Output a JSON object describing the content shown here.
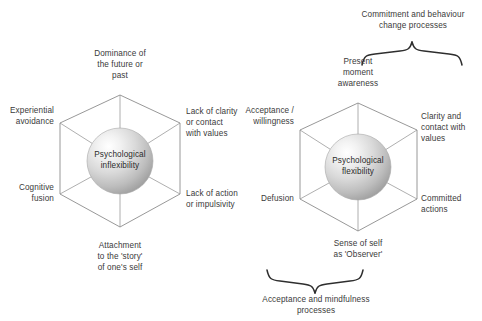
{
  "figure": {
    "title_hidden": "",
    "background_color": "#ffffff",
    "line_color": "#8c8c8c",
    "text_color": "#3a3a3a",
    "brace_color": "#2e2e2e"
  },
  "left_model": {
    "core_label": "Psychological\ninflexibility",
    "vertices": [
      {
        "position": "top",
        "label": "Dominance of\nthe future or\npast"
      },
      {
        "position": "upper-right",
        "label": "Lack of clarity\nor contact\nwith values"
      },
      {
        "position": "lower-right",
        "label": "Lack of action\nor impulsivity"
      },
      {
        "position": "bottom",
        "label": "Attachment\nto the 'story'\nof one's self"
      },
      {
        "position": "lower-left",
        "label": "Cognitive\nfusion"
      },
      {
        "position": "upper-left",
        "label": "Experiential\navoidance"
      }
    ]
  },
  "right_model": {
    "core_label": "Psychological\nflexibility",
    "vertices": [
      {
        "position": "top",
        "label": "Present\nmoment\nawareness"
      },
      {
        "position": "upper-right",
        "label": "Clarity and\ncontact with\nvalues"
      },
      {
        "position": "lower-right",
        "label": "Committed\nactions"
      },
      {
        "position": "bottom",
        "label": "Sense of self\nas 'Observer'"
      },
      {
        "position": "lower-left",
        "label": "Defusion"
      },
      {
        "position": "upper-left",
        "label": "Acceptance /\nwillingness"
      }
    ],
    "top_brace_label": "Commitment and behaviour\nchange processes",
    "bottom_brace_label": "Acceptance and mindfulness\nprocesses"
  }
}
